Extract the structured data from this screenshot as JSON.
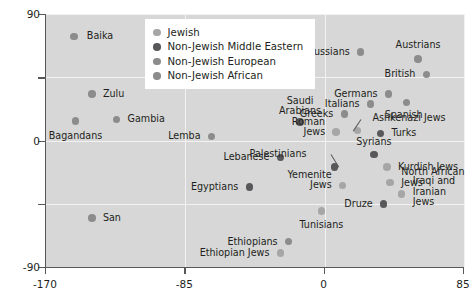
{
  "chart_data": {
    "type": "scatter",
    "title": "",
    "xlabel": "",
    "ylabel": "",
    "xlim": [
      -170,
      85
    ],
    "ylim": [
      -90,
      90
    ],
    "xticks": [
      -170,
      -85,
      0,
      85
    ],
    "xticklabels": [
      "-170",
      "-85",
      "0",
      "85"
    ],
    "yticks": [
      -90,
      -45,
      0,
      45,
      90
    ],
    "yticklabels": [
      "-90",
      "",
      "0",
      "",
      "90"
    ],
    "grid": true,
    "legend_position": "top-center",
    "colors": {
      "jewish": "#a6a6a6",
      "non_jewish_middle_eastern": "#58585a",
      "non_jewish_european": "#8c8c8c",
      "non_jewish_african": "#8c8c8c",
      "plot_background": "#d7d7d7",
      "gridline": "#f2f2f2",
      "axis": "#58585a",
      "text": "#231f20"
    },
    "legend": [
      {
        "label": "Jewish",
        "group": "jewish"
      },
      {
        "label": "Non-Jewish Middle Eastern",
        "group": "non_jewish_middle_eastern"
      },
      {
        "label": "Non-Jewish European",
        "group": "non_jewish_european"
      },
      {
        "label": "Non-Jewish African",
        "group": "non_jewish_african"
      }
    ],
    "points": [
      {
        "label": "Baika",
        "group": "non_jewish_african",
        "x": -153,
        "y": 74,
        "lx": 13,
        "ly": 0,
        "align": "left"
      },
      {
        "label": "Zulu",
        "group": "non_jewish_african",
        "x": -142,
        "y": 33,
        "lx": 11,
        "ly": 0,
        "align": "left"
      },
      {
        "label": "Bagandans",
        "group": "non_jewish_african",
        "x": -152,
        "y": 14,
        "lx": 0,
        "ly": 15,
        "align": "center"
      },
      {
        "label": "Gambia",
        "group": "non_jewish_african",
        "x": -127,
        "y": 15,
        "lx": 11,
        "ly": 0,
        "align": "left"
      },
      {
        "label": "San",
        "group": "non_jewish_african",
        "x": -142,
        "y": -55,
        "lx": 11,
        "ly": 0,
        "align": "left"
      },
      {
        "label": "Lemba",
        "group": "non_jewish_african",
        "x": -69,
        "y": 3,
        "lx": -11,
        "ly": 0,
        "align": "right"
      },
      {
        "label": "Ethiopians",
        "group": "non_jewish_african",
        "x": -22,
        "y": -72,
        "lx": -11,
        "ly": 0,
        "align": "right"
      },
      {
        "label": "Ethiopian Jews",
        "group": "jewish",
        "x": -27,
        "y": -80,
        "lx": -11,
        "ly": 0,
        "align": "right"
      },
      {
        "label": "Egyptians",
        "group": "non_jewish_middle_eastern",
        "x": -46,
        "y": -33,
        "lx": -11,
        "ly": 0,
        "align": "right"
      },
      {
        "label": "Lebanese",
        "group": "non_jewish_middle_eastern",
        "x": -27,
        "y": -12,
        "lx": -11,
        "ly": 0,
        "align": "right"
      },
      {
        "label": "Palestinians",
        "group": "non_jewish_middle_eastern",
        "x": 6,
        "y": -19,
        "lx": -28,
        "ly": -13,
        "align": "right",
        "leader": true
      },
      {
        "label": "Saudi Arabians",
        "group": "non_jewish_middle_eastern",
        "x": -15,
        "y": 13,
        "lx": 0,
        "ly": -16,
        "align": "center",
        "multiline": "Saudi|Arabians"
      },
      {
        "label": "Tunisians",
        "group": "jewish",
        "x": -2,
        "y": -50,
        "lx": 0,
        "ly": 14,
        "align": "center"
      },
      {
        "label": "Yemenite Jews",
        "group": "jewish",
        "x": 11,
        "y": -32,
        "lx": -11,
        "ly": -5,
        "align": "right",
        "multiline": "Yemenite|Jews"
      },
      {
        "label": "Greeks",
        "group": "non_jewish_european",
        "x": 12,
        "y": 19,
        "lx": -11,
        "ly": 0,
        "align": "right"
      },
      {
        "label": "Roman Jews",
        "group": "jewish",
        "x": 7,
        "y": 6,
        "lx": -11,
        "ly": -5,
        "align": "right",
        "multiline": "Roman|Jews"
      },
      {
        "label": "Italians",
        "group": "non_jewish_european",
        "x": 28,
        "y": 26,
        "lx": -11,
        "ly": 0,
        "align": "right"
      },
      {
        "label": "Ashkenazi Jews",
        "group": "jewish",
        "x": 20,
        "y": 7,
        "lx": 15,
        "ly": -12,
        "align": "left",
        "leader": true
      },
      {
        "label": "Turks",
        "group": "non_jewish_middle_eastern",
        "x": 34,
        "y": 5,
        "lx": 11,
        "ly": 0,
        "align": "left"
      },
      {
        "label": "Syrians",
        "group": "non_jewish_middle_eastern",
        "x": 30,
        "y": -10,
        "lx": 0,
        "ly": -12,
        "align": "center"
      },
      {
        "label": "Kurdish Jews",
        "group": "jewish",
        "x": 38,
        "y": -19,
        "lx": 11,
        "ly": 0,
        "align": "left"
      },
      {
        "label": "North African Jews",
        "group": "jewish",
        "x": 40,
        "y": -30,
        "lx": 11,
        "ly": -5,
        "align": "left",
        "multiline": "North African|Jews"
      },
      {
        "label": "Iraqi and Iranian Jews",
        "group": "jewish",
        "x": 47,
        "y": -38,
        "lx": 11,
        "ly": -2,
        "align": "left",
        "multiline": "Iraqi and|Iranian|Jews"
      },
      {
        "label": "Druze",
        "group": "non_jewish_middle_eastern",
        "x": 36,
        "y": -45,
        "lx": -11,
        "ly": 0,
        "align": "right"
      },
      {
        "label": "Germans",
        "group": "non_jewish_european",
        "x": 39,
        "y": 33,
        "lx": -11,
        "ly": 0,
        "align": "right"
      },
      {
        "label": "Spanish",
        "group": "non_jewish_european",
        "x": 50,
        "y": 27,
        "lx": -3,
        "ly": 13,
        "align": "center"
      },
      {
        "label": "Russians",
        "group": "non_jewish_european",
        "x": 22,
        "y": 63,
        "lx": -11,
        "ly": 0,
        "align": "right"
      },
      {
        "label": "Austrians",
        "group": "non_jewish_european",
        "x": 57,
        "y": 58,
        "lx": 0,
        "ly": -14,
        "align": "center"
      },
      {
        "label": "British",
        "group": "non_jewish_european",
        "x": 62,
        "y": 47,
        "lx": -11,
        "ly": 0,
        "align": "right"
      }
    ]
  }
}
